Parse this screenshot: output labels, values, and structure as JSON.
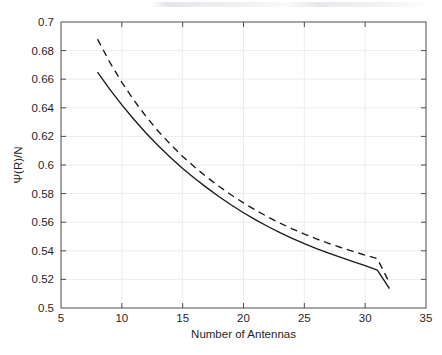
{
  "figure": {
    "background_color": "#ffffff",
    "axis_color": "#4d4d4d",
    "grid_color": "#ececed",
    "line_color": "#1a1a1a"
  },
  "chart_data": {
    "type": "line",
    "title": "",
    "subtitle": "",
    "xlabel": "Number of Antennas",
    "ylabel": "Ψ(R)/N",
    "xlim": [
      5,
      35
    ],
    "ylim": [
      0.5,
      0.7
    ],
    "xticks": [
      5,
      10,
      15,
      20,
      25,
      30,
      35
    ],
    "xtick_labels": [
      "5",
      "10",
      "15",
      "20",
      "25",
      "30",
      "35"
    ],
    "yticks": [
      0.5,
      0.52,
      0.54,
      0.56,
      0.58,
      0.6,
      0.62,
      0.64,
      0.66,
      0.68,
      0.7
    ],
    "ytick_labels": [
      "0.5",
      "0.52",
      "0.54",
      "0.56",
      "0.58",
      "0.6",
      "0.62",
      "0.64",
      "0.66",
      "0.68",
      "0.7"
    ],
    "grid": true,
    "legend": null,
    "legend_position": "none",
    "x": [
      8,
      9,
      10,
      11,
      12,
      13,
      14,
      15,
      16,
      17,
      18,
      19,
      20,
      21,
      22,
      23,
      24,
      25,
      26,
      27,
      28,
      29,
      30,
      31,
      32
    ],
    "series": [
      {
        "name": "solid",
        "style": "solid",
        "color": "#1a1a1a",
        "values": [
          0.665,
          0.653,
          0.642,
          0.6318,
          0.6222,
          0.6134,
          0.6052,
          0.5976,
          0.5906,
          0.584,
          0.5778,
          0.572,
          0.5666,
          0.5616,
          0.557,
          0.5527,
          0.5487,
          0.545,
          0.5416,
          0.5384,
          0.5354,
          0.5325,
          0.5296,
          0.5265,
          0.5135
        ]
      },
      {
        "name": "dashed",
        "style": "dashed",
        "color": "#1a1a1a",
        "values": [
          0.688,
          0.672,
          0.6578,
          0.6452,
          0.6338,
          0.6236,
          0.6144,
          0.606,
          0.5984,
          0.5914,
          0.585,
          0.579,
          0.5735,
          0.5684,
          0.5637,
          0.5594,
          0.5554,
          0.5517,
          0.5483,
          0.5452,
          0.5423,
          0.5396,
          0.537,
          0.5345,
          0.5175
        ]
      }
    ]
  }
}
